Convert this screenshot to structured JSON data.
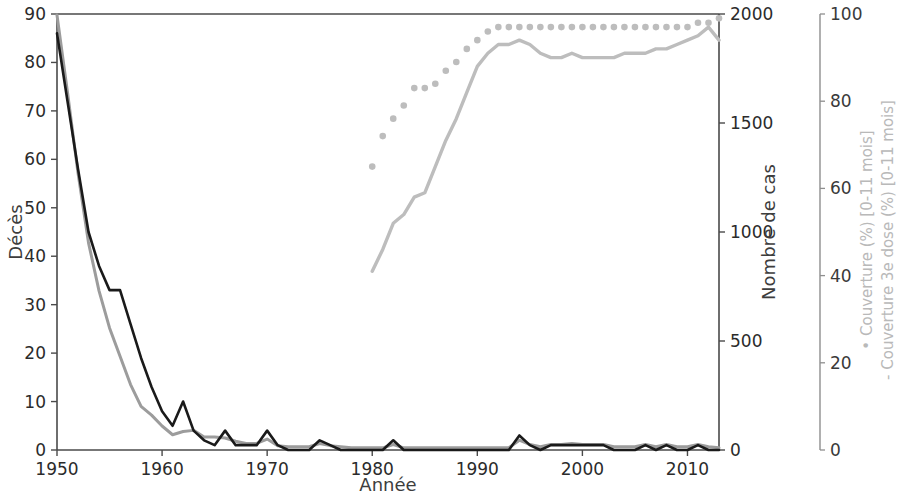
{
  "chart_data": {
    "type": "line",
    "title": "",
    "xlabel": "Année",
    "xlim": [
      1950,
      2013
    ],
    "xticks": [
      1950,
      1960,
      1970,
      1980,
      1990,
      2000,
      2010
    ],
    "xtick_labels": [
      "1950",
      "1960",
      "1970",
      "1980",
      "1990",
      "2000",
      "2010"
    ],
    "grid": false,
    "legend_position": "right-axis-label",
    "axes": [
      {
        "id": "left",
        "label": "Décès",
        "lim": [
          0,
          90
        ],
        "ticks": [
          0,
          10,
          20,
          30,
          40,
          50,
          60,
          70,
          80,
          90
        ],
        "tick_labels": [
          "0",
          "10",
          "20",
          "30",
          "40",
          "50",
          "60",
          "70",
          "80",
          "90"
        ],
        "color": "#2b2b2b"
      },
      {
        "id": "right1",
        "label": "Nombre de cas",
        "lim": [
          0,
          2000
        ],
        "ticks": [
          0,
          500,
          1000,
          1500,
          2000
        ],
        "tick_labels": [
          "0",
          "500",
          "1000",
          "1500",
          "2000"
        ],
        "color": "#3d3d3d"
      },
      {
        "id": "right2",
        "label": "• Couverture (%) [0-11 mois]\n- Couverture 3e dose (%) [0-11 mois]",
        "label_line1": "• Couverture (%) [0-11 mois]",
        "label_line2": "- Couverture 3e dose (%) [0-11 mois]",
        "lim": [
          0,
          100
        ],
        "ticks": [
          0,
          20,
          40,
          60,
          80,
          100
        ],
        "tick_labels": [
          "0",
          "20",
          "40",
          "60",
          "80",
          "100"
        ],
        "color": "#b9b9b9"
      }
    ],
    "series": [
      {
        "name": "Décès",
        "axis": "left",
        "style": "line",
        "color": "#1a1a1a",
        "x": [
          1950,
          1951,
          1952,
          1953,
          1954,
          1955,
          1956,
          1957,
          1958,
          1959,
          1960,
          1961,
          1962,
          1963,
          1964,
          1965,
          1966,
          1967,
          1968,
          1969,
          1970,
          1971,
          1972,
          1973,
          1974,
          1975,
          1976,
          1977,
          1978,
          1979,
          1980,
          1981,
          1982,
          1983,
          1984,
          1985,
          1986,
          1987,
          1988,
          1989,
          1990,
          1991,
          1992,
          1993,
          1994,
          1995,
          1996,
          1997,
          1998,
          1999,
          2000,
          2001,
          2002,
          2003,
          2004,
          2005,
          2006,
          2007,
          2008,
          2009,
          2010,
          2011,
          2012,
          2013
        ],
        "y": [
          86,
          72,
          58,
          45,
          38,
          33,
          33,
          26,
          19,
          13,
          8,
          5,
          10,
          4,
          2,
          1,
          4,
          1,
          1,
          1,
          4,
          1,
          0,
          0,
          0,
          2,
          1,
          0,
          0,
          0,
          0,
          0,
          2,
          0,
          0,
          0,
          0,
          0,
          0,
          0,
          0,
          0,
          0,
          0,
          3,
          1,
          0,
          1,
          1,
          1,
          1,
          1,
          1,
          0,
          0,
          0,
          1,
          0,
          1,
          0,
          0,
          1,
          0,
          0
        ]
      },
      {
        "name": "Nombre de cas",
        "axis": "right1",
        "style": "line",
        "color": "#9c9c9c",
        "x": [
          1950,
          1951,
          1952,
          1953,
          1954,
          1955,
          1956,
          1957,
          1958,
          1959,
          1960,
          1961,
          1962,
          1963,
          1964,
          1965,
          1966,
          1967,
          1968,
          1969,
          1970,
          1971,
          1972,
          1973,
          1974,
          1975,
          1976,
          1977,
          1978,
          1979,
          1980,
          1981,
          1982,
          1983,
          1984,
          1985,
          1986,
          1987,
          1988,
          1989,
          1990,
          1991,
          1992,
          1993,
          1994,
          1995,
          1996,
          1997,
          1998,
          1999,
          2000,
          2001,
          2002,
          2003,
          2004,
          2005,
          2006,
          2007,
          2008,
          2009,
          2010,
          2011,
          2012,
          2013
        ],
        "y": [
          1995,
          1640,
          1270,
          950,
          730,
          560,
          430,
          300,
          200,
          160,
          110,
          70,
          85,
          90,
          60,
          60,
          55,
          40,
          30,
          30,
          50,
          20,
          15,
          15,
          15,
          30,
          20,
          15,
          10,
          10,
          10,
          10,
          25,
          10,
          10,
          10,
          10,
          10,
          10,
          10,
          10,
          10,
          10,
          10,
          45,
          25,
          15,
          25,
          25,
          30,
          25,
          25,
          25,
          15,
          15,
          15,
          25,
          15,
          25,
          15,
          15,
          25,
          15,
          10
        ]
      },
      {
        "name": "Couverture (%) [0-11 mois]",
        "axis": "right2",
        "style": "dots",
        "color": "#bdbdbd",
        "x": [
          1980,
          1981,
          1982,
          1983,
          1984,
          1985,
          1986,
          1987,
          1988,
          1989,
          1990,
          1991,
          1992,
          1993,
          1994,
          1995,
          1996,
          1997,
          1998,
          1999,
          2000,
          2001,
          2002,
          2003,
          2004,
          2005,
          2006,
          2007,
          2008,
          2009,
          2010,
          2011,
          2012,
          2013
        ],
        "y": [
          65,
          72,
          76,
          79,
          83,
          83,
          84,
          87,
          89,
          92,
          94,
          96,
          97,
          97,
          97,
          97,
          97,
          97,
          97,
          97,
          97,
          97,
          97,
          97,
          97,
          97,
          97,
          97,
          97,
          97,
          97,
          98,
          98,
          99
        ]
      },
      {
        "name": "Couverture 3e dose (%) [0-11 mois]",
        "axis": "right2",
        "style": "line",
        "color": "#bdbdbd",
        "x": [
          1980,
          1981,
          1982,
          1983,
          1984,
          1985,
          1986,
          1987,
          1988,
          1989,
          1990,
          1991,
          1992,
          1993,
          1994,
          1995,
          1996,
          1997,
          1998,
          1999,
          2000,
          2001,
          2002,
          2003,
          2004,
          2005,
          2006,
          2007,
          2008,
          2009,
          2010,
          2011,
          2012,
          2013
        ],
        "y": [
          41,
          46,
          52,
          54,
          58,
          59,
          65,
          71,
          76,
          82,
          88,
          91,
          93,
          93,
          94,
          93,
          91,
          90,
          90,
          91,
          90,
          90,
          90,
          90,
          91,
          91,
          91,
          92,
          92,
          93,
          94,
          95,
          97,
          94
        ]
      }
    ]
  }
}
